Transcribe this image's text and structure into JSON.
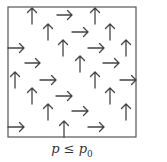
{
  "figure": {
    "frame": {
      "x": 8,
      "y": 7,
      "w": 128,
      "h": 130,
      "color": "#555555"
    },
    "arrow_color": "#444444",
    "up_arrows": [
      {
        "x": 32,
        "y1": 8,
        "y2": 24
      },
      {
        "x": 95,
        "y1": 8,
        "y2": 24
      },
      {
        "x": 48,
        "y1": 24,
        "y2": 40
      },
      {
        "x": 110,
        "y1": 24,
        "y2": 40
      },
      {
        "x": 63,
        "y1": 40,
        "y2": 56
      },
      {
        "x": 126,
        "y1": 40,
        "y2": 56
      },
      {
        "x": 80,
        "y1": 56,
        "y2": 72
      },
      {
        "x": 15,
        "y1": 72,
        "y2": 88
      },
      {
        "x": 95,
        "y1": 72,
        "y2": 88
      },
      {
        "x": 32,
        "y1": 88,
        "y2": 104
      },
      {
        "x": 110,
        "y1": 88,
        "y2": 104
      },
      {
        "x": 48,
        "y1": 104,
        "y2": 120
      },
      {
        "x": 126,
        "y1": 104,
        "y2": 120
      },
      {
        "x": 64,
        "y1": 121,
        "y2": 137
      }
    ],
    "right_arrows": [
      {
        "y": 15,
        "x1": 57,
        "x2": 72
      },
      {
        "y": 32,
        "x1": 72,
        "x2": 88
      },
      {
        "y": 48,
        "x1": 8,
        "x2": 24
      },
      {
        "y": 48,
        "x1": 88,
        "x2": 104
      },
      {
        "y": 63,
        "x1": 25,
        "x2": 40
      },
      {
        "y": 63,
        "x1": 103,
        "x2": 119
      },
      {
        "y": 80,
        "x1": 40,
        "x2": 56
      },
      {
        "y": 80,
        "x1": 120,
        "x2": 136
      },
      {
        "y": 96,
        "x1": 56,
        "x2": 72
      },
      {
        "y": 111,
        "x1": 72,
        "x2": 88
      },
      {
        "y": 127,
        "x1": 8,
        "x2": 24
      },
      {
        "y": 127,
        "x1": 88,
        "x2": 104
      }
    ],
    "caption": {
      "var": "p",
      "relation": " ≤ ",
      "rhs": "p",
      "rhs_sub": "0"
    }
  }
}
